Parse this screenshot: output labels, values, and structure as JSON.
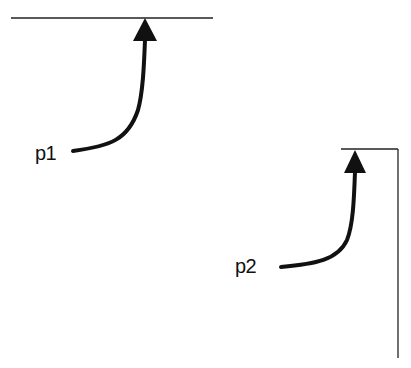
{
  "diagram": {
    "labels": {
      "p1": "p1",
      "p2": "p2"
    },
    "colors": {
      "stroke": "#111111",
      "thin_line": "#222222",
      "background": "#ffffff"
    },
    "elements": [
      {
        "name": "top-horizontal-line",
        "type": "line",
        "from": [
          11,
          18
        ],
        "to": [
          213,
          18
        ]
      },
      {
        "name": "p1-arrow",
        "type": "curved-arrow",
        "start": [
          72,
          151
        ],
        "tip": [
          145,
          18
        ],
        "label": "p1"
      },
      {
        "name": "bracket-horizontal",
        "type": "line",
        "from": [
          341,
          149
        ],
        "to": [
          398,
          149
        ]
      },
      {
        "name": "bracket-vertical",
        "type": "line",
        "from": [
          398,
          149
        ],
        "to": [
          398,
          358
        ]
      },
      {
        "name": "p2-arrow",
        "type": "curved-arrow",
        "start": [
          280,
          267
        ],
        "tip": [
          355,
          150
        ],
        "label": "p2"
      }
    ]
  }
}
